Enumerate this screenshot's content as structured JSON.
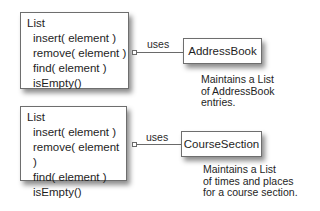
{
  "diagrams": [
    {
      "list": {
        "title": "List",
        "operations": [
          "insert( element )",
          "remove( element )",
          "find( element )",
          "isEmpty()"
        ]
      },
      "relation": "uses",
      "target": "AddressBook",
      "note": [
        "Maintains a List",
        "of AddressBook",
        "entries."
      ]
    },
    {
      "list": {
        "title": "List",
        "operations": [
          "insert( element )",
          "remove( element )",
          "find( element )",
          "isEmpty()"
        ]
      },
      "relation": "uses",
      "target": "CourseSection",
      "note": [
        "Maintains a List",
        "of times and places",
        "for a course section."
      ]
    }
  ],
  "colors": {
    "border": "#6e6e6e",
    "text": "#1e1e1e",
    "background": "#ffffff"
  }
}
